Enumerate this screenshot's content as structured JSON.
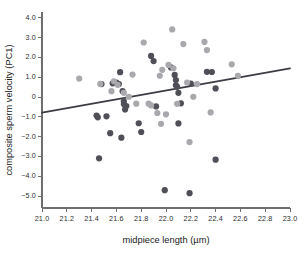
{
  "chart_data": {
    "type": "scatter",
    "title": "",
    "xlabel": "midpiece length (µm)",
    "ylabel": "composite sperm velocity (PC1)",
    "xlim": [
      21.0,
      23.0
    ],
    "ylim": [
      -5.6,
      4.2
    ],
    "grid": false,
    "legend": "none",
    "xticks": [
      "21.0",
      "21.2",
      "21.4",
      "21.6",
      "21.8",
      "22.0",
      "22.2",
      "22.4",
      "22.6",
      "22.8",
      "23.0"
    ],
    "xtick_values": [
      21.0,
      21.2,
      21.4,
      21.6,
      21.8,
      22.0,
      22.2,
      22.4,
      22.6,
      22.8,
      23.0
    ],
    "yticks": [
      "4.0",
      "3.0",
      "2.0",
      "1.0",
      "0",
      "−1.0",
      "−2.0",
      "−3.0",
      "−4.0",
      "−5.0"
    ],
    "ytick_values": [
      4.0,
      3.0,
      2.0,
      1.0,
      0.0,
      -1.0,
      -2.0,
      -3.0,
      -4.0,
      -5.0
    ],
    "colors": {
      "dark_group": "#4f4f57",
      "light_group": "#a9a9ad",
      "trend_line": "#3c3c44",
      "axis": "#6e6e6e",
      "text": "#1a1a1a",
      "background": "#ffffff"
    },
    "marker_size_px": 4.2,
    "trend_line_fit": {
      "x_start": 21.0,
      "y_start": -0.78,
      "x_end": 23.0,
      "y_end": 1.45
    },
    "series": [
      {
        "name": "dark_group",
        "color": "#4f4f57",
        "points": [
          [
            21.44,
            -0.93
          ],
          [
            21.45,
            -1.02
          ],
          [
            21.46,
            -3.09
          ],
          [
            21.48,
            0.66
          ],
          [
            21.52,
            -0.97
          ],
          [
            21.55,
            -1.82
          ],
          [
            21.57,
            0.7
          ],
          [
            21.6,
            0.74
          ],
          [
            21.62,
            0.66
          ],
          [
            21.63,
            1.26
          ],
          [
            21.64,
            -2.05
          ],
          [
            21.65,
            0.3
          ],
          [
            21.66,
            -0.21
          ],
          [
            21.66,
            -0.35
          ],
          [
            21.67,
            -0.62
          ],
          [
            21.68,
            -0.45
          ],
          [
            21.78,
            -1.32
          ],
          [
            21.8,
            -1.76
          ],
          [
            21.88,
            2.08
          ],
          [
            21.9,
            1.82
          ],
          [
            21.92,
            -0.47
          ],
          [
            21.99,
            -4.7
          ],
          [
            22.04,
            1.5
          ],
          [
            22.07,
            1.12
          ],
          [
            22.08,
            0.86
          ],
          [
            22.08,
            0.6
          ],
          [
            22.09,
            0.52
          ],
          [
            22.1,
            0.22
          ],
          [
            22.1,
            -1.33
          ],
          [
            22.12,
            -0.31
          ],
          [
            22.19,
            -4.85
          ],
          [
            22.2,
            0.68
          ],
          [
            22.33,
            1.28
          ],
          [
            22.37,
            1.27
          ],
          [
            22.4,
            0.44
          ],
          [
            22.4,
            -3.16
          ]
        ]
      },
      {
        "name": "light_group",
        "color": "#a9a9ad",
        "points": [
          [
            21.3,
            0.94
          ],
          [
            21.47,
            0.67
          ],
          [
            21.56,
            0.3
          ],
          [
            21.58,
            0.8
          ],
          [
            21.61,
            0.62
          ],
          [
            21.66,
            0.22
          ],
          [
            21.7,
            0.02
          ],
          [
            21.73,
            1.14
          ],
          [
            21.76,
            -0.33
          ],
          [
            21.82,
            2.76
          ],
          [
            21.86,
            -0.33
          ],
          [
            21.88,
            -0.42
          ],
          [
            21.93,
            -0.8
          ],
          [
            21.95,
            1.08
          ],
          [
            21.96,
            -1.35
          ],
          [
            21.97,
            1.38
          ],
          [
            22.0,
            -0.87
          ],
          [
            22.02,
            1.63
          ],
          [
            22.05,
            3.42
          ],
          [
            22.06,
            1.46
          ],
          [
            22.09,
            -0.34
          ],
          [
            22.14,
            2.68
          ],
          [
            22.17,
            0.74
          ],
          [
            22.19,
            -2.27
          ],
          [
            22.22,
            0.02
          ],
          [
            22.25,
            0.66
          ],
          [
            22.31,
            2.79
          ],
          [
            22.33,
            2.38
          ],
          [
            22.36,
            -0.77
          ],
          [
            22.53,
            1.66
          ],
          [
            22.58,
            1.08
          ]
        ]
      }
    ]
  }
}
